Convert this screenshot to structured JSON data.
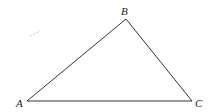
{
  "diagram": {
    "type": "triangle",
    "vertices": [
      {
        "label": "A",
        "x": 27,
        "y": 101
      },
      {
        "label": "B",
        "x": 126,
        "y": 19
      },
      {
        "label": "C",
        "x": 192,
        "y": 101
      }
    ],
    "stroke_color": "#333333",
    "label_color": "#222222"
  }
}
